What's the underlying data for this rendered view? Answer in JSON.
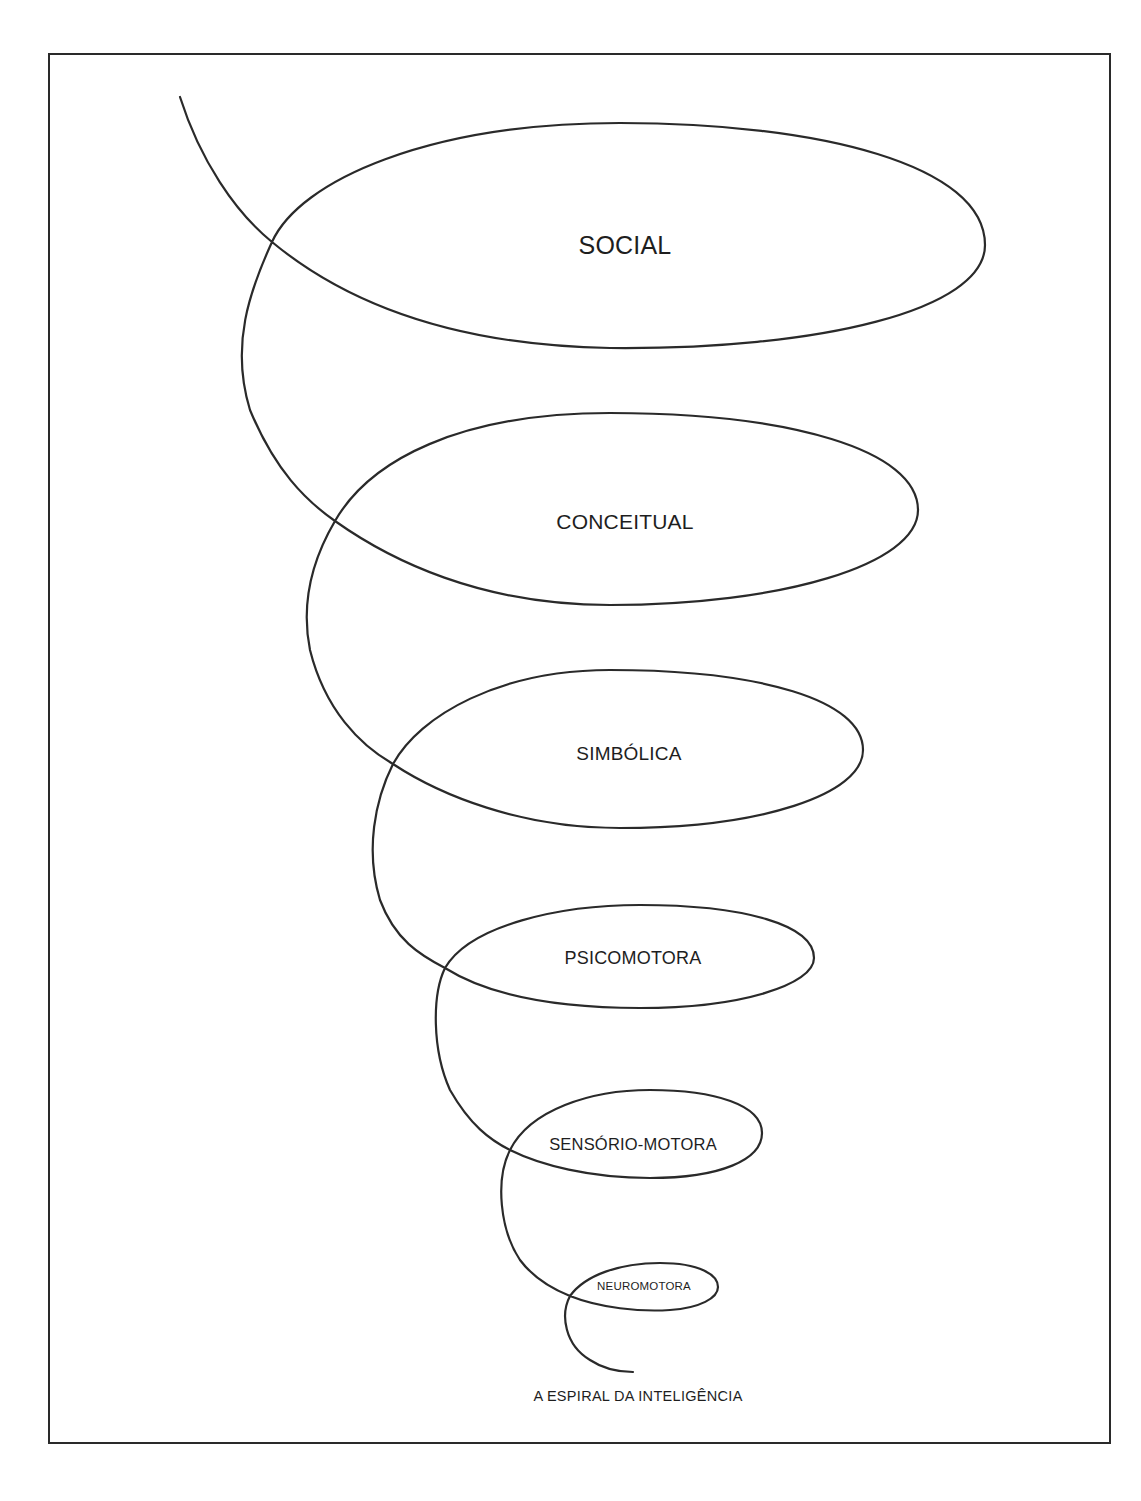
{
  "figure": {
    "title": "A ESPIRAL DA INTELIGÊNCIA",
    "stroke_color": "#2a2a2a",
    "levels": [
      {
        "label": "SOCIAL",
        "order": 6
      },
      {
        "label": "CONCEITUAL",
        "order": 5
      },
      {
        "label": "SIMBÓLICA",
        "order": 4
      },
      {
        "label": "PSICOMOTORA",
        "order": 3
      },
      {
        "label": "SENSÓRIO-MOTORA",
        "order": 2
      },
      {
        "label": "NEUROMOTORA",
        "order": 1
      }
    ]
  }
}
